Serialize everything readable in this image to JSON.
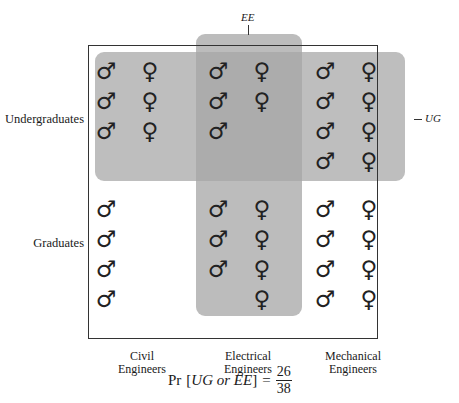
{
  "labels": {
    "ee_tag": "EE",
    "ug_tag": "UG",
    "row_undergraduates": "Undergraduates",
    "row_graduates": "Graduates",
    "col_civil_line1": "Civil",
    "col_civil_line2": "Engineers",
    "col_electrical_line1": "Electrical",
    "col_electrical_line2": "Engineers",
    "col_mechanical_line1": "Mechanical",
    "col_mechanical_line2": "Engineers"
  },
  "symbols": {
    "male": "♂",
    "female": "♀"
  },
  "formula": {
    "prefix": "Pr",
    "open": "[",
    "event": "UG or EE",
    "close": "]",
    "equals": "=",
    "numerator": "26",
    "denominator": "38"
  },
  "counts": {
    "undergraduates": {
      "civil": {
        "male": 3,
        "female": 3
      },
      "electrical": {
        "male": 3,
        "female": 2
      },
      "mechanical": {
        "male": 4,
        "female": 4
      }
    },
    "graduates": {
      "civil": {
        "male": 4,
        "female": 0
      },
      "electrical": {
        "male": 3,
        "female": 4
      },
      "mechanical": {
        "male": 4,
        "female": 4
      }
    },
    "total": 38,
    "ug_or_ee": 26
  },
  "colors": {
    "ug_shade": "#b3b3b3",
    "ee_shade": "#a6a6a6",
    "border": "#333333"
  }
}
